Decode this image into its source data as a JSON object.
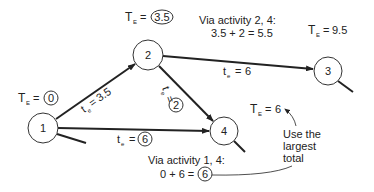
{
  "diagram": {
    "type": "pert-network",
    "nodes": [
      {
        "id": "1",
        "label": "1",
        "cx": 43,
        "cy": 128,
        "r": 15
      },
      {
        "id": "2",
        "label": "2",
        "cx": 148,
        "cy": 55,
        "r": 15
      },
      {
        "id": "3",
        "label": "3",
        "cx": 328,
        "cy": 71,
        "r": 14
      },
      {
        "id": "4",
        "label": "4",
        "cx": 224,
        "cy": 131,
        "r": 14
      }
    ],
    "edges": [
      {
        "from": "1",
        "to": "2",
        "label_prefix": "t",
        "label_sub": "e",
        "label_value": "3.5",
        "circled": false
      },
      {
        "from": "2",
        "to": "4",
        "label_prefix": "t",
        "label_sub": "e",
        "label_value": "2",
        "circled": true
      },
      {
        "from": "2",
        "to": "3",
        "label_prefix": "t",
        "label_sub": "e",
        "label_value": "6",
        "circled": false
      },
      {
        "from": "1",
        "to": "4",
        "label_prefix": "t",
        "label_sub": "e",
        "label_value": "6",
        "circled": true
      }
    ],
    "annotations": {
      "node1_te": {
        "prefix": "T",
        "sub": "E",
        "value": "0"
      },
      "node2_te": {
        "prefix": "T",
        "sub": "E",
        "value": "3.5"
      },
      "node3_te": {
        "prefix": "T",
        "sub": "E",
        "value": "9.5"
      },
      "node4_te": {
        "prefix": "T",
        "sub": "E",
        "value": "6"
      },
      "via_24_title": "Via activity 2, 4:",
      "via_24_calc": "3.5 + 2 = 5.5",
      "via_14_title": "Via activity 1, 4:",
      "via_14_calc_prefix": "0 + 6 =",
      "via_14_calc_result": "6",
      "note_line1": "Use the",
      "note_line2": "largest",
      "note_line3": "total"
    }
  }
}
